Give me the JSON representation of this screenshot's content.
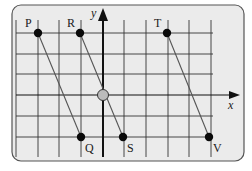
{
  "figure": {
    "panel": {
      "x": 12,
      "y": 5,
      "width": 232,
      "height": 156,
      "rx": 9,
      "fill": "#ebebeb",
      "stroke": "#555555"
    },
    "grid": {
      "vertical_x": [
        16,
        38,
        59,
        81,
        124,
        146,
        168,
        189,
        211
      ],
      "vertical_y_range": [
        20,
        157
      ],
      "horizontal_y": [
        33,
        54,
        74,
        116,
        137
      ],
      "horizontal_x_range": [
        16,
        213
      ],
      "color": "#333333"
    },
    "axes": {
      "x_axis": {
        "y": 95,
        "x1": 16,
        "x2": 240,
        "label": "x",
        "label_pos": [
          228,
          109
        ]
      },
      "y_axis": {
        "x": 103,
        "y1": 157,
        "y2": 8,
        "label": "y",
        "label_pos": [
          91,
          17
        ]
      },
      "color": "#111111"
    },
    "origin_marker": {
      "x": 103,
      "y": 95,
      "r": 5.5,
      "fill": "#bbbbbb",
      "stroke": "#333333"
    },
    "points": [
      {
        "name": "P",
        "x": 38,
        "y": 33,
        "label_pos": [
          25,
          27
        ]
      },
      {
        "name": "R",
        "x": 80,
        "y": 33,
        "label_pos": [
          67,
          27
        ]
      },
      {
        "name": "T",
        "x": 167,
        "y": 33,
        "label_pos": [
          154,
          27
        ]
      },
      {
        "name": "Q",
        "x": 81,
        "y": 137,
        "label_pos": [
          85,
          152
        ]
      },
      {
        "name": "S",
        "x": 123,
        "y": 137,
        "label_pos": [
          127,
          152
        ]
      },
      {
        "name": "V",
        "x": 209,
        "y": 137,
        "label_pos": [
          213,
          152
        ]
      }
    ],
    "segments": [
      {
        "from": "P",
        "to": "Q"
      },
      {
        "from": "R",
        "to": "S"
      },
      {
        "from": "T",
        "to": "V"
      }
    ],
    "point_color": "#0a0a0a",
    "segment_color": "#555555"
  }
}
